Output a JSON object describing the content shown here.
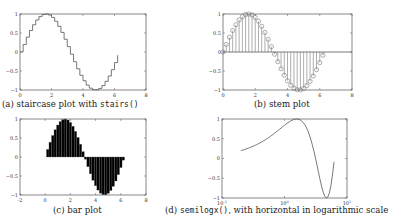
{
  "captions": {
    "a_prefix": "(a) staircase plot with ",
    "a_code": "stairs()",
    "b": "(b) stem plot",
    "c": "(c) bar plot",
    "d_code": "semilogx()",
    "d_suffix": ", with horizontal in logarithmic scale"
  },
  "chart_data": [
    {
      "type": "line",
      "style": "stairs",
      "title": "(a) staircase plot with stairs()",
      "x_ticks": [
        "0",
        "2",
        "4",
        "6",
        "8"
      ],
      "y_ticks": [
        "-1",
        "-0.5",
        "0",
        "0.5",
        "1"
      ],
      "xlim": [
        0,
        8
      ],
      "ylim": [
        -1,
        1
      ],
      "function": "sin(x)",
      "x_range": [
        0,
        6.2
      ],
      "step": 0.2,
      "grid": false
    },
    {
      "type": "stem",
      "title": "(b) stem plot",
      "x_ticks": [
        "0",
        "2",
        "4",
        "6",
        "8"
      ],
      "y_ticks": [
        "-1",
        "-0.5",
        "0",
        "0.5",
        "1"
      ],
      "xlim": [
        0,
        8
      ],
      "ylim": [
        -1,
        1
      ],
      "function": "sin(x)",
      "x_range": [
        0,
        6.2
      ],
      "step": 0.2,
      "marker": "circle",
      "grid": false
    },
    {
      "type": "bar",
      "title": "(c) bar plot",
      "x_ticks": [
        "-2",
        "0",
        "2",
        "4",
        "6",
        "8"
      ],
      "y_ticks": [
        "-1",
        "-0.5",
        "0",
        "0.5",
        "1"
      ],
      "xlim": [
        -2,
        8
      ],
      "ylim": [
        -1,
        1
      ],
      "function": "sin(x)",
      "x_range": [
        0,
        6.2
      ],
      "step": 0.2,
      "bar_color": "#000000",
      "grid": false
    },
    {
      "type": "line",
      "title": "(d) semilogx(), with horizontal in logarithmic scale",
      "x_scale": "log",
      "x_ticks": [
        "10^-1",
        "10^0",
        "10^1"
      ],
      "y_ticks": [
        "-1",
        "-0.5",
        "0",
        "0.5",
        "1"
      ],
      "xlim": [
        0.1,
        10
      ],
      "ylim": [
        -1,
        1
      ],
      "function": "sin(x)",
      "x_range": [
        0.2,
        6.2
      ],
      "grid": false
    }
  ]
}
